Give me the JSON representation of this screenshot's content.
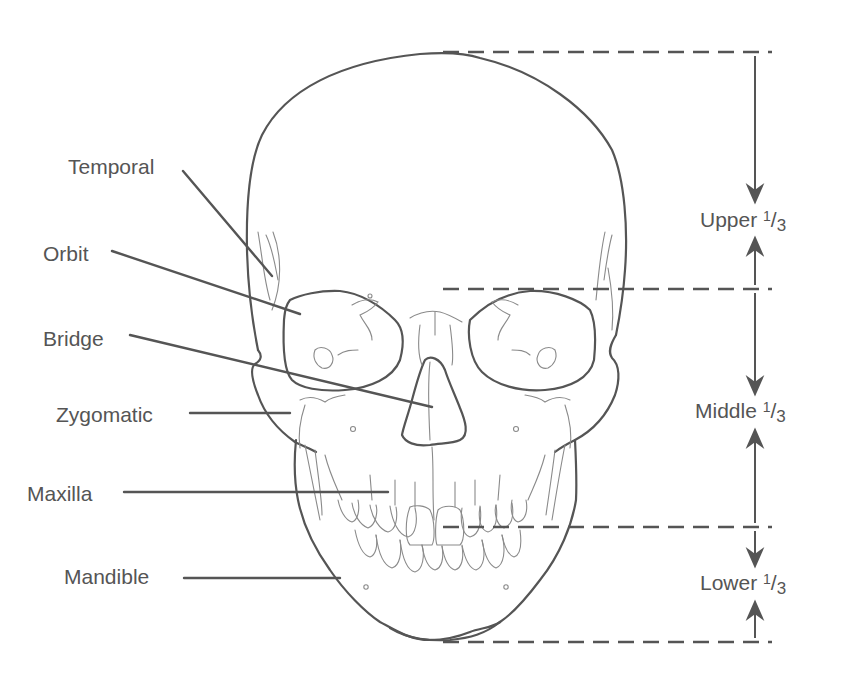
{
  "figure": {
    "stroke_color": "#555555",
    "fine_stroke_color": "#8a8a8a",
    "background": "#ffffff"
  },
  "labels": [
    {
      "id": "temporal",
      "text": "Temporal",
      "x": 68,
      "y": 156,
      "leader": [
        183,
        171,
        272,
        276
      ]
    },
    {
      "id": "orbit",
      "text": "Orbit",
      "x": 43,
      "y": 243,
      "leader": [
        112,
        251,
        300,
        314
      ]
    },
    {
      "id": "bridge",
      "text": "Bridge",
      "x": 43,
      "y": 328,
      "leader": [
        130,
        335,
        432,
        407
      ]
    },
    {
      "id": "zygomatic",
      "text": "Zygomatic",
      "x": 56,
      "y": 404,
      "leader": [
        190,
        413,
        290,
        413
      ]
    },
    {
      "id": "maxilla",
      "text": "Maxilla",
      "x": 27,
      "y": 483,
      "leader": [
        124,
        492,
        388,
        492
      ]
    },
    {
      "id": "mandible",
      "text": "Mandible",
      "x": 64,
      "y": 566,
      "leader": [
        184,
        578,
        340,
        578
      ]
    }
  ],
  "thirds": {
    "guide_lines_y": [
      52,
      289,
      527,
      642
    ],
    "guide_line_x_start": 443,
    "guide_line_x_end": 772,
    "arrow_x": 755,
    "sections": [
      {
        "id": "upper",
        "word": "Upper",
        "numerator": "1",
        "denominator": "3",
        "x": 700,
        "y": 209
      },
      {
        "id": "middle",
        "word": "Middle",
        "numerator": "1",
        "denominator": "3",
        "x": 695,
        "y": 400
      },
      {
        "id": "lower",
        "word": "Lower",
        "numerator": "1",
        "denominator": "3",
        "x": 700,
        "y": 572
      }
    ]
  }
}
